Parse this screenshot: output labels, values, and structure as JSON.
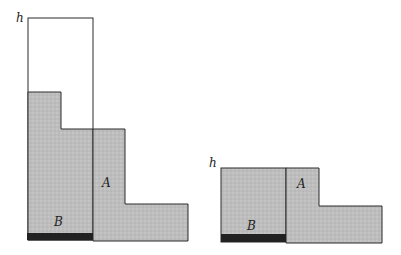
{
  "figure": {
    "colors": {
      "fill": "#b9b9b9",
      "stroke": "#2a2a2a",
      "base_bar": "#222222",
      "background": "#ffffff"
    },
    "left_panel": {
      "height_label": "h",
      "region_a_label": "A",
      "region_b_label": "B"
    },
    "right_panel": {
      "height_label": "h",
      "region_a_label": "A",
      "region_b_label": "B"
    }
  }
}
